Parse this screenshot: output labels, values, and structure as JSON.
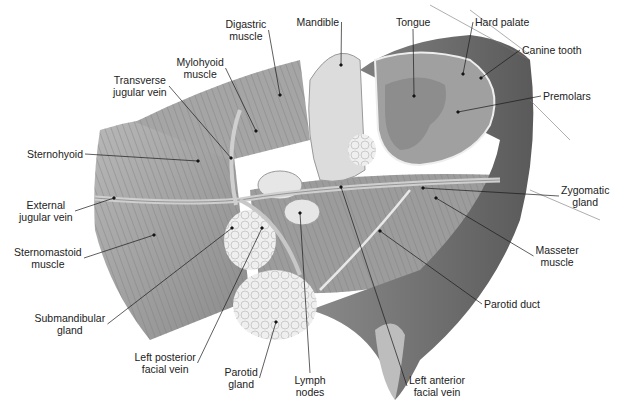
{
  "diagram": {
    "labels": [
      {
        "id": "digastric-muscle",
        "lines": [
          "Digastric",
          "muscle"
        ],
        "x": 246,
        "y": 24,
        "point": [
          280,
          95
        ]
      },
      {
        "id": "mandible",
        "lines": [
          "Mandible"
        ],
        "x": 318,
        "y": 22,
        "point": [
          341,
          65
        ]
      },
      {
        "id": "tongue",
        "lines": [
          "Tongue"
        ],
        "x": 413,
        "y": 22,
        "point": [
          414,
          96
        ]
      },
      {
        "id": "hard-palate",
        "lines": [
          "Hard palate"
        ],
        "x": 502,
        "y": 22,
        "point": [
          463,
          74
        ]
      },
      {
        "id": "canine-tooth",
        "lines": [
          "Canine tooth"
        ],
        "x": 552,
        "y": 50,
        "point": [
          481,
          78
        ]
      },
      {
        "id": "premolars",
        "lines": [
          "Premolars"
        ],
        "x": 567,
        "y": 96,
        "point": [
          458,
          112
        ]
      },
      {
        "id": "mylohyoid-muscle",
        "lines": [
          "Mylohyoid",
          "muscle"
        ],
        "x": 200,
        "y": 62,
        "point": [
          256,
          131
        ]
      },
      {
        "id": "transverse-jugular-vein",
        "lines": [
          "Transverse",
          "jugular vein"
        ],
        "x": 140,
        "y": 80,
        "point": [
          231,
          158
        ]
      },
      {
        "id": "sternohyoid",
        "lines": [
          "Sternohyoid"
        ],
        "x": 55,
        "y": 154,
        "point": [
          198,
          161
        ]
      },
      {
        "id": "external-jugular-vein",
        "lines": [
          "External",
          "jugular vein"
        ],
        "x": 46,
        "y": 205,
        "point": [
          114,
          198
        ]
      },
      {
        "id": "sternomastoid-muscle",
        "lines": [
          "Sternomastoid",
          "muscle"
        ],
        "x": 48,
        "y": 252,
        "point": [
          154,
          235
        ]
      },
      {
        "id": "submandibular-gland",
        "lines": [
          "Submandibular",
          "gland"
        ],
        "x": 70,
        "y": 318,
        "point": [
          232,
          228
        ]
      },
      {
        "id": "left-posterior-facial-vein",
        "lines": [
          "Left posterior",
          "facial vein"
        ],
        "x": 165,
        "y": 357,
        "point": [
          262,
          228
        ]
      },
      {
        "id": "parotid-gland",
        "lines": [
          "Parotid",
          "gland"
        ],
        "x": 241,
        "y": 372,
        "point": [
          276,
          322
        ]
      },
      {
        "id": "lymph-nodes",
        "lines": [
          "Lymph",
          "nodes"
        ],
        "x": 310,
        "y": 380,
        "point": [
          300,
          213
        ]
      },
      {
        "id": "left-anterior-facial-vein",
        "lines": [
          "Left anterior",
          "facial vein"
        ],
        "x": 437,
        "y": 380,
        "point": [
          341,
          187
        ]
      },
      {
        "id": "parotid-duct",
        "lines": [
          "Parotid duct"
        ],
        "x": 512,
        "y": 304,
        "point": [
          380,
          231
        ]
      },
      {
        "id": "masseter-muscle",
        "lines": [
          "Masseter",
          "muscle"
        ],
        "x": 557,
        "y": 250,
        "point": [
          436,
          198
        ]
      },
      {
        "id": "zygomatic-gland",
        "lines": [
          "Zygomatic",
          "gland"
        ],
        "x": 585,
        "y": 190,
        "point": [
          423,
          188
        ]
      }
    ],
    "colors": {
      "text": "#222222",
      "leader": "#1a1a1a",
      "muscle": "#9a9a9a",
      "muscle_light": "#c4c4c4",
      "fur": "#6e6e6e",
      "gland": "#ececec",
      "vein": "#b0b0b0",
      "tongue": "#8d8d8d"
    }
  }
}
